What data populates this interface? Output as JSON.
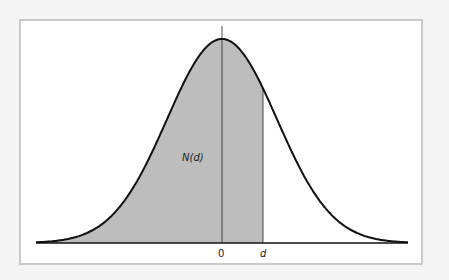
{
  "diagram": {
    "area_label": "N(d)",
    "x_ticks": [
      "0",
      "d"
    ],
    "colors": {
      "shade": "#bdbdbd",
      "curve": "#111111",
      "frame": "#c9c9c9",
      "background": "#f4f4f4"
    }
  },
  "chart_data": {
    "type": "area",
    "title": "",
    "x_tick_labels": [
      "0",
      "d"
    ],
    "annotations": [
      "N(d)"
    ],
    "shaded_region": {
      "from": "-inf",
      "to": "d"
    },
    "d_value_sigma": 0.75,
    "grid": false,
    "legend": "none"
  }
}
